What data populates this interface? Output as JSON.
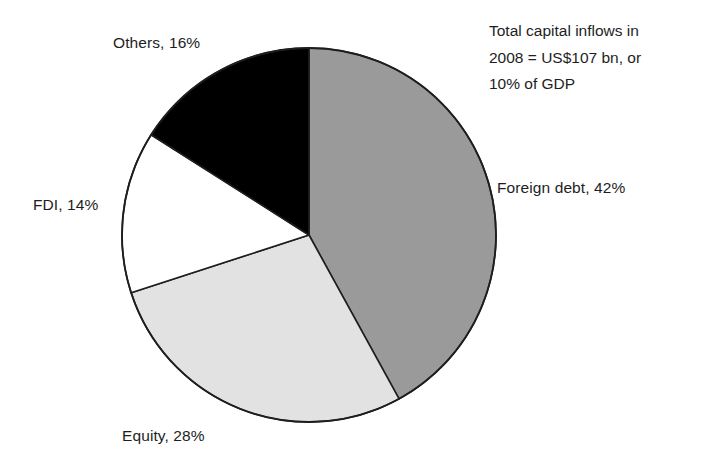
{
  "chart_data": {
    "type": "pie",
    "title": "",
    "subtitle": "",
    "xlabel": "",
    "ylabel": "",
    "legend_position": "none",
    "grid": false,
    "unit": "percent",
    "start_angle_deg": 0,
    "direction": "clockwise",
    "categories": [
      "Foreign debt",
      "Equity",
      "FDI",
      "Others"
    ],
    "values": [
      42,
      28,
      14,
      16
    ],
    "slices": [
      {
        "name": "Foreign debt",
        "value": 42,
        "label": "Foreign debt, 42%",
        "color": "#9a9a9a",
        "start_deg": 0,
        "end_deg": 151.2
      },
      {
        "name": "Equity",
        "value": 28,
        "label": "Equity, 28%",
        "color": "#e2e2e2",
        "start_deg": 151.2,
        "end_deg": 252.0
      },
      {
        "name": "FDI",
        "value": 14,
        "label": "FDI, 14%",
        "color": "#ffffff",
        "start_deg": 252.0,
        "end_deg": 302.4
      },
      {
        "name": "Others",
        "value": 16,
        "label": "Others, 16%",
        "color": "#000000",
        "start_deg": 302.4,
        "end_deg": 360.0
      }
    ],
    "annotation": {
      "lines": [
        "Total capital inflows in",
        "2008 = US$107 bn, or",
        "10% of GDP"
      ],
      "full_text": "Total capital inflows in 2008 = US$107 bn, or 10% of GDP"
    },
    "outline_color": "#1e1e1e",
    "background": "#ffffff"
  },
  "labels": {
    "others": "Others, 16%",
    "fdi": "FDI, 14%",
    "equity": "Equity, 28%",
    "foreign_debt": "Foreign debt, 42%"
  },
  "annotation": {
    "line1": "Total capital inflows in",
    "line2": "2008 = US$107 bn, or",
    "line3": "10% of GDP"
  }
}
